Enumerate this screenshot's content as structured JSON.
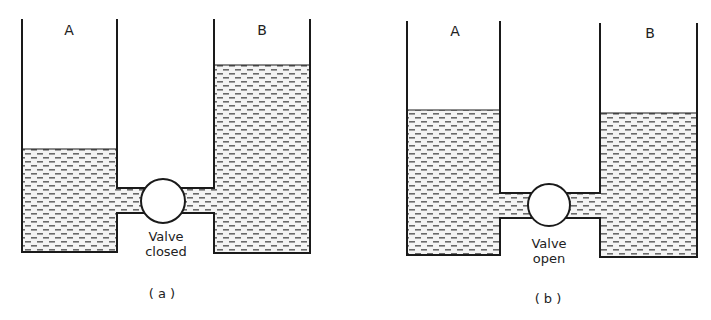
{
  "figures": [
    {
      "id": "a",
      "caption": "( a )",
      "tank_a_label": "A",
      "tank_b_label": "B",
      "valve_label_line1": "Valve",
      "valve_label_line2": "closed",
      "valve_state": "closed"
    },
    {
      "id": "b",
      "caption": "( b )",
      "tank_a_label": "A",
      "tank_b_label": "B",
      "valve_label_line1": "Valve",
      "valve_label_line2": "open",
      "valve_state": "open"
    }
  ],
  "colors": {
    "line": "#1a1a1a",
    "liquid_dash": "#6a6a6a",
    "background": "#ffffff"
  }
}
